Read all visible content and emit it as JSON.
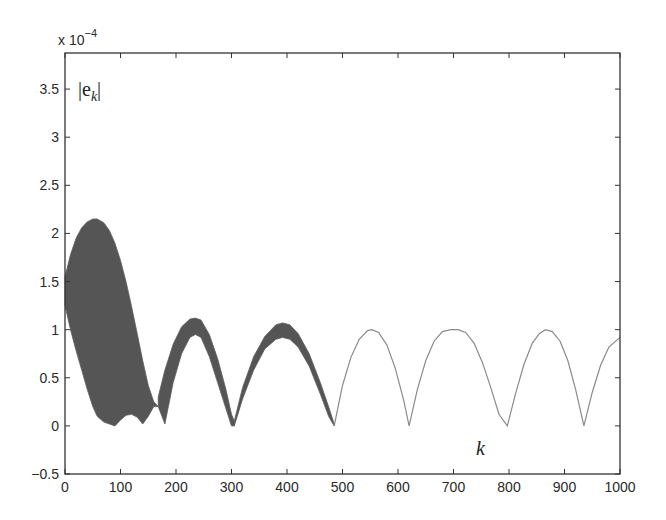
{
  "chart_data": {
    "type": "line",
    "title": "",
    "xlabel": "k",
    "ylabel": "|e_k|",
    "y_scale_note": "x 10^-4",
    "y_multiplier_base": "x 10",
    "y_multiplier_exp": "−4",
    "xlim": [
      0,
      1000
    ],
    "ylim": [
      -0.5,
      3.875
    ],
    "grid": false,
    "legend": null,
    "x_ticks": [
      0,
      100,
      200,
      300,
      400,
      500,
      600,
      700,
      800,
      900,
      1000
    ],
    "x_tick_labels": [
      "0",
      "100",
      "200",
      "300",
      "400",
      "500",
      "600",
      "700",
      "800",
      "900",
      "1000"
    ],
    "y_ticks": [
      -0.5,
      0,
      0.5,
      1,
      1.5,
      2,
      2.5,
      3,
      3.5
    ],
    "y_tick_labels": [
      "−0.5",
      "0",
      "0.5",
      "1",
      "1.5",
      "2",
      "2.5",
      "3",
      "3.5"
    ],
    "series": [
      {
        "name": "|e_k| oscillating band (envelope)",
        "style": "filled-band",
        "color": "#555555",
        "segments": [
          {
            "k": [
              0,
              10,
              20,
              30,
              40,
              50,
              58,
              70,
              80,
              90,
              100,
              110,
              120,
              130,
              140,
              150,
              160,
              168
            ],
            "upper": [
              1.55,
              1.78,
              1.95,
              2.06,
              2.12,
              2.15,
              2.15,
              2.11,
              2.03,
              1.9,
              1.72,
              1.5,
              1.24,
              0.96,
              0.68,
              0.42,
              0.25,
              0.2
            ],
            "lower": [
              1.25,
              1.0,
              0.78,
              0.58,
              0.38,
              0.2,
              0.1,
              0.04,
              0.02,
              0.0,
              0.06,
              0.11,
              0.12,
              0.09,
              0.02,
              0.1,
              0.2,
              0.2
            ]
          },
          {
            "k": [
              168,
              180,
              195,
              210,
              225,
              235,
              245,
              260,
              275,
              290,
              300,
              305
            ],
            "upper": [
              0.3,
              0.58,
              0.85,
              1.03,
              1.11,
              1.12,
              1.1,
              0.95,
              0.7,
              0.38,
              0.12,
              0.05
            ],
            "lower": [
              0.2,
              0.02,
              0.45,
              0.75,
              0.92,
              0.95,
              0.92,
              0.72,
              0.45,
              0.18,
              0.0,
              0.0
            ]
          },
          {
            "k": [
              305,
              320,
              340,
              360,
              380,
              392,
              405,
              420,
              440,
              460,
              475,
              485
            ],
            "upper": [
              0.05,
              0.4,
              0.72,
              0.93,
              1.05,
              1.07,
              1.05,
              0.96,
              0.75,
              0.45,
              0.2,
              0.02
            ],
            "lower": [
              0.0,
              0.28,
              0.58,
              0.8,
              0.9,
              0.92,
              0.9,
              0.82,
              0.62,
              0.33,
              0.1,
              0.0
            ]
          }
        ]
      },
      {
        "name": "|e_k| single curve",
        "style": "line",
        "color": "#8a8a8a",
        "x": [
          485,
          500,
          515,
          530,
          545,
          553,
          565,
          580,
          595,
          610,
          620,
          635,
          650,
          665,
          680,
          695,
          708,
          722,
          737,
          752,
          767,
          782,
          797,
          812,
          827,
          842,
          855,
          866,
          878,
          892,
          906,
          920,
          935,
          950,
          965,
          980,
          1000
        ],
        "y": [
          0.0,
          0.42,
          0.71,
          0.9,
          0.99,
          1.0,
          0.97,
          0.84,
          0.6,
          0.27,
          0.0,
          0.38,
          0.68,
          0.88,
          0.98,
          1.0,
          1.0,
          0.97,
          0.86,
          0.66,
          0.4,
          0.12,
          0.0,
          0.34,
          0.64,
          0.86,
          0.96,
          1.0,
          0.98,
          0.88,
          0.68,
          0.38,
          0.0,
          0.35,
          0.63,
          0.82,
          0.92
        ]
      }
    ],
    "annotations": [
      {
        "text": "|e_k|",
        "x": 10,
        "y": 3.48
      },
      {
        "text": "k",
        "x": 750,
        "y": -0.15
      }
    ]
  },
  "labels": {
    "ylabel_text": "|e",
    "ylabel_sub": "k",
    "ylabel_close": "|",
    "xlabel_text": "k",
    "multiplier_base": "x 10",
    "multiplier_exp": "−4"
  }
}
